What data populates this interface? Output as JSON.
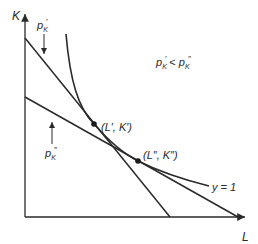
{
  "diagram": {
    "axes": {
      "y_label": "K",
      "x_label": "L"
    },
    "labels": {
      "price_prime": {
        "base": "p",
        "sub": "K",
        "sup": "′"
      },
      "price_double_prime": {
        "base": "p",
        "sub": "K",
        "sup": "″"
      },
      "inequality_left": {
        "base": "p",
        "sub": "K",
        "sup": "′"
      },
      "inequality_op": " < ",
      "inequality_right": {
        "base": "p",
        "sub": "K",
        "sup": "″"
      },
      "point_prime": "(L′, K′)",
      "point_double_prime": "(L″, K″)",
      "isoquant": "y = 1"
    },
    "colors": {
      "line": "#2a2a2a",
      "background": "#ffffff"
    }
  }
}
